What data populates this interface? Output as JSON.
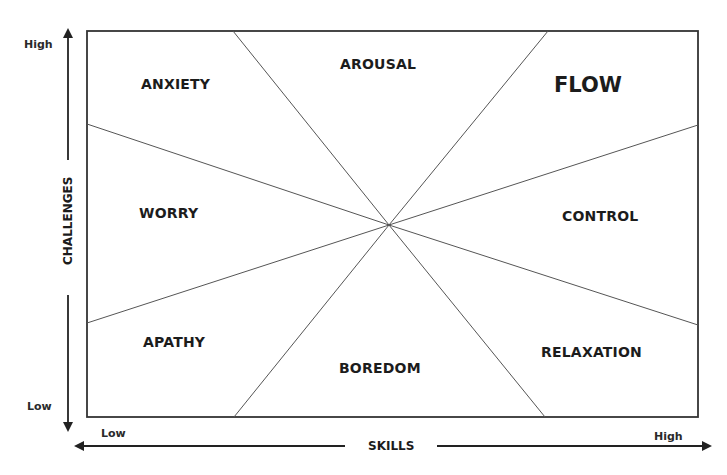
{
  "diagram": {
    "type": "flow-channel-model",
    "y_axis": {
      "title": "CHALLENGES",
      "high_label": "High",
      "low_label": "Low"
    },
    "x_axis": {
      "title": "SKILLS",
      "low_label": "Low",
      "high_label": "High"
    },
    "states": {
      "anxiety": "ANXIETY",
      "arousal": "AROUSAL",
      "flow": "FLOW",
      "worry": "WORRY",
      "control": "CONTROL",
      "apathy": "APATHY",
      "boredom": "BOREDOM",
      "relaxation": "RELAXATION"
    },
    "colors": {
      "line": "#555555",
      "border": "#333333",
      "text": "#1c1c1c"
    }
  }
}
